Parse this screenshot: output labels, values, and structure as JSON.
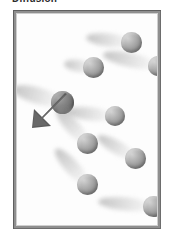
{
  "caption": {
    "text": "Diffusion"
  },
  "figure": {
    "frame": {
      "border_color": "#8f8f8f",
      "background_color": "#fdfdfd",
      "x": 13,
      "y": 10,
      "width": 148,
      "height": 219
    },
    "sphere_color": "#9d9d9d",
    "highlight_sphere_color": "#777777",
    "trail_color": "#b0b0b0",
    "arrow_color": "#595959",
    "arrow": {
      "label": "velocity-arrow",
      "direction": "down-left",
      "x": 4,
      "y": 78,
      "width": 48,
      "height": 46
    },
    "particles": [
      {
        "id": 1,
        "x": 104,
        "y": 18,
        "size": 21,
        "trail_angle": 186,
        "trail_length": 46,
        "trail_thickness": 13,
        "dark": false
      },
      {
        "id": 2,
        "x": 66,
        "y": 43,
        "size": 21,
        "trail_angle": 188,
        "trail_length": 30,
        "trail_thickness": 12,
        "dark": false
      },
      {
        "id": 3,
        "x": 131,
        "y": 42,
        "size": 20,
        "trail_angle": 192,
        "trail_length": 56,
        "trail_thickness": 14,
        "dark": false
      },
      {
        "id": 4,
        "x": 34,
        "y": 77,
        "size": 23,
        "trail_angle": 196,
        "trail_length": 52,
        "trail_thickness": 16,
        "dark": true
      },
      {
        "id": 5,
        "x": 88,
        "y": 92,
        "size": 20,
        "trail_angle": 186,
        "trail_length": 50,
        "trail_thickness": 13,
        "dark": false
      },
      {
        "id": 6,
        "x": 60,
        "y": 119,
        "size": 21,
        "trail_angle": 228,
        "trail_length": 46,
        "trail_thickness": 14,
        "dark": false
      },
      {
        "id": 7,
        "x": 108,
        "y": 134,
        "size": 21,
        "trail_angle": 210,
        "trail_length": 44,
        "trail_thickness": 13,
        "dark": false
      },
      {
        "id": 8,
        "x": 60,
        "y": 160,
        "size": 21,
        "trail_angle": 228,
        "trail_length": 48,
        "trail_thickness": 14,
        "dark": false
      },
      {
        "id": 9,
        "x": 126,
        "y": 182,
        "size": 21,
        "trail_angle": 185,
        "trail_length": 56,
        "trail_thickness": 13,
        "dark": false
      }
    ]
  }
}
